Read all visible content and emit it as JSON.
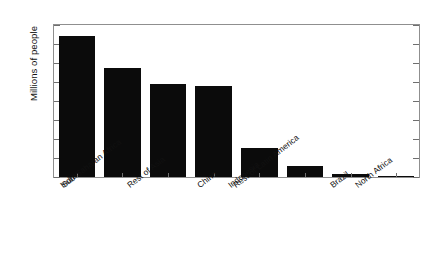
{
  "chart_data": {
    "type": "bar",
    "title": "",
    "subtitle": "",
    "xlabel": "",
    "ylabel": "Millions of people",
    "categories": [
      "India",
      "Sub-Saharan Africa",
      "Rest of Asia",
      "China",
      "Indonesia",
      "Rest of Latin America",
      "Brazil",
      "North Africa"
    ],
    "values": [
      740,
      575,
      490,
      480,
      155,
      58,
      18,
      4
    ],
    "ylim": [
      0,
      800
    ],
    "ytick_values": [
      0,
      100,
      200,
      300,
      400,
      500,
      600,
      700,
      800
    ],
    "ytick_labels": [
      "0",
      "100",
      "200",
      "300",
      "400",
      "500",
      "600",
      "700",
      "800"
    ],
    "grid": false,
    "legend": null,
    "legend_position": "none",
    "bar_color": "#0b0b0b",
    "axis_color": "#8f8f8f",
    "background_color": "#ffffff",
    "xtick_label_rotation": -38
  },
  "figure": {
    "name": "population-bar-chart"
  }
}
